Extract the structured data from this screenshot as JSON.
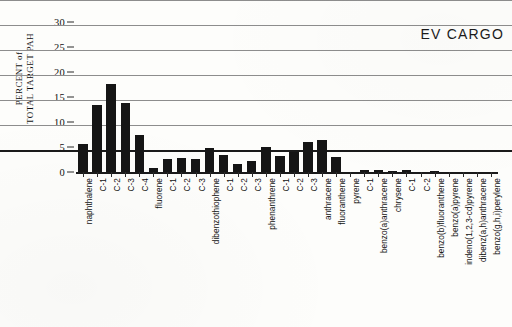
{
  "chart_data": {
    "type": "bar",
    "title": "EV CARGO",
    "xlabel": "",
    "ylabel": "PERCENT of TOTAL TARGET PAH",
    "ylabel_lines": [
      "PERCENT of",
      "TOTAL TARGET PAH"
    ],
    "ylim": [
      0,
      30
    ],
    "yticks": [
      0,
      5,
      10,
      15,
      20,
      25,
      30
    ],
    "ytick_labels": [
      "0",
      "5",
      "10",
      "15",
      "20",
      "25",
      "30"
    ],
    "grid": true,
    "grid_axis": "y",
    "legend": null,
    "bar_color": "#151515",
    "grid_color": "#8d8d8d",
    "axis_color": "#1a1a1a",
    "categories": [
      "naphthalene",
      "C-1",
      "C-2",
      "C-3",
      "C-4",
      "fluorene",
      "C-1",
      "C-2",
      "C-3",
      "dibenzothiophene",
      "C-1",
      "C-2",
      "C-3",
      "phenanthrene",
      "C-1",
      "C-2",
      "C-3",
      "anthracene",
      "fluoranthene",
      "pyrene",
      "C-1",
      "benzo(a)anthracene",
      "chrysene",
      "C-1",
      "C-2",
      "benzo(b)fluoranthene",
      "benzo(a)pyrene",
      "indeno(1,2,3-cd)pyrene",
      "dibenz(a,h)anthracene",
      "benzo(g,h,i)perylene"
    ],
    "values": [
      5.6,
      13.4,
      17.7,
      13.9,
      7.5,
      0.9,
      2.6,
      2.9,
      2.6,
      4.8,
      3.5,
      1.7,
      2.2,
      5.0,
      3.3,
      4.0,
      6.0,
      6.4,
      3.1,
      0.0,
      0.35,
      0.4,
      0.3,
      0.45,
      0.0,
      0.3,
      0.0,
      0.0,
      0.0,
      0.0
    ]
  }
}
